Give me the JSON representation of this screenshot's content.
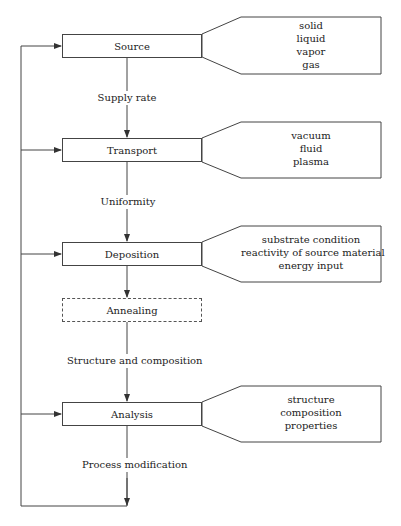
{
  "diagram": {
    "steps": [
      {
        "id": "source",
        "label": "Source",
        "style": "solid"
      },
      {
        "id": "transport",
        "label": "Transport",
        "style": "solid"
      },
      {
        "id": "deposition",
        "label": "Deposition",
        "style": "solid"
      },
      {
        "id": "annealing",
        "label": "Annealing",
        "style": "dashed"
      },
      {
        "id": "analysis",
        "label": "Analysis",
        "style": "solid"
      }
    ],
    "connectors": [
      {
        "from": "source",
        "to": "transport",
        "label": "Supply rate"
      },
      {
        "from": "transport",
        "to": "deposition",
        "label": "Uniformity"
      },
      {
        "from": "annealing",
        "to": "analysis",
        "label": "Structure and composition"
      },
      {
        "from": "analysis",
        "to": "feedback",
        "label": "Process modification"
      }
    ],
    "callouts": {
      "source": [
        "solid",
        "liquid",
        "vapor",
        "gas"
      ],
      "transport": [
        "vacuum",
        "fluid",
        "plasma"
      ],
      "deposition": [
        "substrate condition",
        "reactivity of source material",
        "energy input"
      ],
      "analysis": [
        "structure",
        "composition",
        "properties"
      ]
    },
    "colors": {
      "line": "#444444",
      "background": "#ffffff"
    }
  }
}
